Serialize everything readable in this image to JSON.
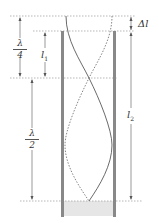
{
  "diagram": {
    "labels": {
      "delta_l": "Δl",
      "quarter_wavelength_num": "λ",
      "quarter_wavelength_den": "4",
      "l1": "l",
      "l1_sub": "1",
      "half_wavelength_num": "λ",
      "half_wavelength_den": "2",
      "l2": "l",
      "l2_sub": "2"
    },
    "colors": {
      "tube_wall": "#777777",
      "water": "#e6e6e6",
      "guide_line": "#999999",
      "wave_solid": "#444444",
      "wave_dashed": "#666666"
    }
  }
}
